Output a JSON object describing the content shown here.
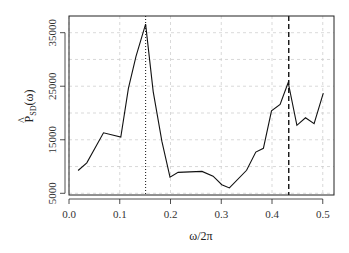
{
  "chart_data": {
    "type": "line",
    "title": "",
    "xlabel": "ω/2π",
    "ylabel": "P̂_SD(ω)",
    "ylabel_main": "P",
    "ylabel_hat": "^",
    "ylabel_sub": "SD",
    "ylabel_arg": "(ω)",
    "xlim": [
      0.0,
      0.52
    ],
    "ylim": [
      5000,
      38000
    ],
    "grid": true,
    "x_ticks": [
      0.0,
      0.1,
      0.2,
      0.3,
      0.4,
      0.5
    ],
    "x_tick_labels": [
      "0.0",
      "0.1",
      "0.2",
      "0.3",
      "0.4",
      "0.5"
    ],
    "y_ticks": [
      5000,
      15000,
      25000,
      35000
    ],
    "y_tick_labels": [
      "5000",
      "15000",
      "25000",
      "35000"
    ],
    "y_grid": [
      5000,
      10000,
      15000,
      20000,
      25000,
      30000,
      35000
    ],
    "x": [
      0.018,
      0.035,
      0.068,
      0.102,
      0.117,
      0.132,
      0.151,
      0.166,
      0.183,
      0.199,
      0.215,
      0.238,
      0.262,
      0.284,
      0.301,
      0.316,
      0.35,
      0.368,
      0.383,
      0.399,
      0.416,
      0.432,
      0.449,
      0.466,
      0.483,
      0.501
    ],
    "values": [
      9260,
      10700,
      16300,
      15500,
      24600,
      30600,
      36600,
      24000,
      14700,
      8000,
      8900,
      9000,
      9100,
      8200,
      6600,
      6000,
      9300,
      12700,
      13400,
      20400,
      21600,
      25700,
      17700,
      19100,
      18000,
      23700
    ],
    "vlines": [
      {
        "x": 0.151,
        "style": "dotted"
      },
      {
        "x": 0.433,
        "style": "dashed"
      }
    ]
  }
}
